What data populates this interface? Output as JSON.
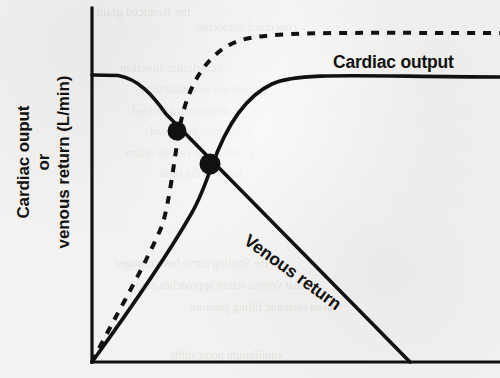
{
  "figure": {
    "name": "cardiac-output-venous-return-curves",
    "background_color": "#f3f2f0",
    "ink_color": "#111111"
  },
  "axes": {
    "y_label_line1": "Cardiac ouput",
    "y_label_line2": "or",
    "y_label_line3": "venous return (L/min)",
    "x_label": "",
    "origin_px": [
      92,
      362
    ],
    "y_axis_top_px": 8,
    "x_axis_right_px": 500
  },
  "labels": {
    "cardiac_output": "Cardiac output",
    "venous_return": "Venous return"
  },
  "ghost_text": [
    {
      "text": "the Reduced grant",
      "x": 96,
      "y": 4,
      "size": 13
    },
    {
      "text": "concerned ultracenes",
      "x": 196,
      "y": 20,
      "size": 12
    },
    {
      "text": "ventricular function",
      "x": 120,
      "y": 60,
      "size": 13
    },
    {
      "text": "an increase in contractility",
      "x": 140,
      "y": 82,
      "size": 12
    },
    {
      "text": "a decrease in afterload",
      "x": 132,
      "y": 104,
      "size": 12
    },
    {
      "text": "an increase in preload",
      "x": 150,
      "y": 124,
      "size": 12
    },
    {
      "text": "a shift in the venous return",
      "x": 126,
      "y": 146,
      "size": 12
    },
    {
      "text": "curve to the right",
      "x": 160,
      "y": 166,
      "size": 12
    },
    {
      "text": "the Starling curve have changed",
      "x": 114,
      "y": 256,
      "size": 12
    },
    {
      "text": "that venous return approaches zero",
      "x": 136,
      "y": 278,
      "size": 12
    },
    {
      "text": "mean systemic filling pressure",
      "x": 190,
      "y": 300,
      "size": 12
    },
    {
      "text": "equilibrium point shifts",
      "x": 170,
      "y": 348,
      "size": 12
    }
  ],
  "chart_data": {
    "type": "line",
    "title": "",
    "xlabel": "",
    "ylabel": "Cardiac ouput or venous return (L/min)",
    "grid": false,
    "legend": "inline-curve-labels",
    "axis_ticks": [],
    "series": [
      {
        "name": "Cardiac output",
        "style": "solid",
        "description": "Rises steeply from origin then plateaus at a fixed cardiac output level",
        "points": [
          [
            92,
            362
          ],
          [
            130,
            310
          ],
          [
            170,
            252
          ],
          [
            200,
            205
          ],
          [
            210,
            164
          ],
          [
            232,
            120
          ],
          [
            252,
            94
          ],
          [
            276,
            81
          ],
          [
            310,
            78
          ],
          [
            360,
            78
          ],
          [
            430,
            78
          ],
          [
            500,
            78
          ]
        ]
      },
      {
        "name": "Cardiac output (shifted / increased contractility)",
        "style": "dashed",
        "description": "Dashed curve rising more steeply and plateauing at a higher output level",
        "points": [
          [
            92,
            362
          ],
          [
            120,
            312
          ],
          [
            150,
            254
          ],
          [
            170,
            206
          ],
          [
            177,
            131
          ],
          [
            196,
            88
          ],
          [
            216,
            58
          ],
          [
            240,
            41
          ],
          [
            274,
            35
          ],
          [
            330,
            34
          ],
          [
            420,
            34
          ],
          [
            500,
            34
          ]
        ]
      },
      {
        "name": "Venous return",
        "style": "solid",
        "description": "Flat near the y-axis then falls linearly to zero at the right",
        "points": [
          [
            92,
            75
          ],
          [
            116,
            76
          ],
          [
            140,
            88
          ],
          [
            160,
            108
          ],
          [
            177,
            131
          ],
          [
            210,
            164
          ],
          [
            260,
            214
          ],
          [
            320,
            274
          ],
          [
            380,
            334
          ],
          [
            410,
            362
          ]
        ]
      }
    ],
    "markers": [
      {
        "name": "equilibrium-point-upper",
        "x_px": 177,
        "y_px": 131,
        "shape": "filled-circle",
        "radius_px": 9
      },
      {
        "name": "equilibrium-point-lower",
        "x_px": 210,
        "y_px": 164,
        "shape": "filled-circle",
        "radius_px": 10
      }
    ]
  }
}
